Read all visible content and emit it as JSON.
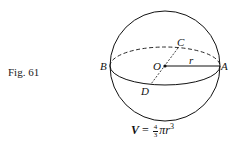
{
  "figure": {
    "label": "Fig. 61",
    "points": {
      "A": "A",
      "B": "B",
      "C": "C",
      "D": "D",
      "O": "O",
      "r": "r"
    },
    "formula": {
      "lhs": "V",
      "equals": "=",
      "frac_num": "4",
      "frac_den": "3",
      "pi": "π",
      "r": "r",
      "exp": "3"
    }
  }
}
